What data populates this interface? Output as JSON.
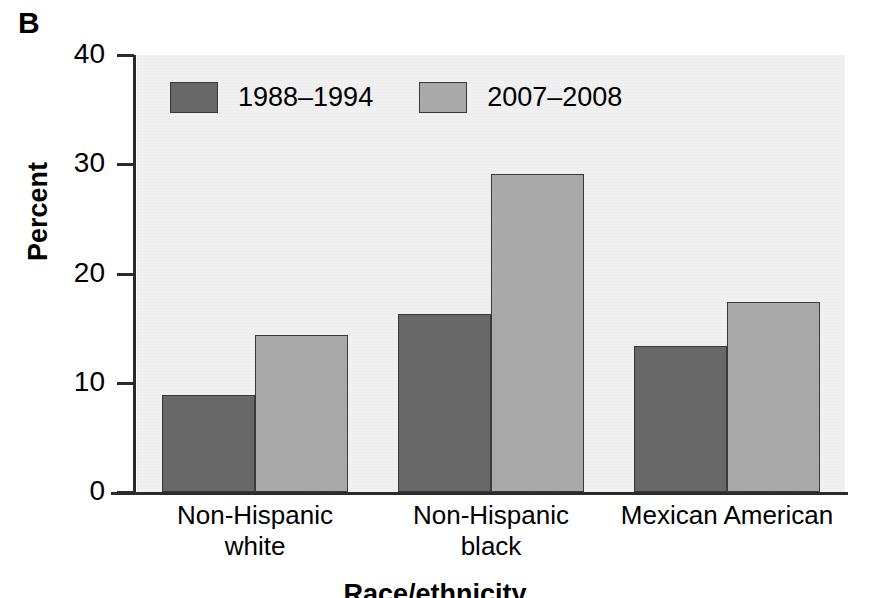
{
  "panel": {
    "label": "B"
  },
  "chart_data": {
    "type": "bar",
    "title": "",
    "subtitle": "",
    "panel_label": "B",
    "xlabel": "Race/ethnicity",
    "ylabel": "Percent",
    "categories": [
      "Non-Hispanic\nwhite",
      "Non-Hispanic\nblack",
      "Mexican American"
    ],
    "series": [
      {
        "name": "1988–1994",
        "color": "#686868",
        "values": [
          8.9,
          16.3,
          13.4
        ]
      },
      {
        "name": "2007–2008",
        "color": "#a9a9a9",
        "values": [
          14.4,
          29.1,
          17.4
        ]
      }
    ],
    "ylim": [
      0,
      40
    ],
    "yticks": [
      0,
      10,
      20,
      30,
      40
    ],
    "ytick_labels": [
      "0",
      "10",
      "20",
      "30",
      "40"
    ],
    "grid": false,
    "legend_position": "upper-left-inside",
    "plot_background": "#f1f1f1",
    "axis_color": "#2b2b2b"
  },
  "axis": {
    "y_title": "Percent",
    "x_title": "Race/ethnicity",
    "y_ticks": [
      "40",
      "30",
      "20",
      "10",
      "0"
    ]
  },
  "legend": {
    "items": [
      {
        "label": "1988–1994"
      },
      {
        "label": "2007–2008"
      }
    ]
  },
  "categories": [
    {
      "label": "Non-Hispanic\nwhite"
    },
    {
      "label": "Non-Hispanic\nblack"
    },
    {
      "label": "Mexican American"
    }
  ]
}
